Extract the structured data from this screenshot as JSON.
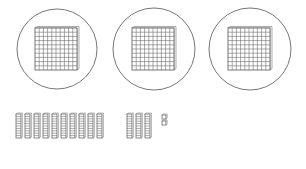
{
  "figure": {
    "colors": {
      "stroke": "#555555",
      "circle": "#777777",
      "fill": "#ffffff"
    },
    "hundreds": {
      "count": 3,
      "circles": [
        {
          "cx": 57,
          "cy": 49,
          "r": 40
        },
        {
          "cx": 154,
          "cy": 49,
          "r": 41
        },
        {
          "cx": 250,
          "cy": 49,
          "r": 41
        }
      ],
      "flat_size": 42,
      "grid": 10
    },
    "tens": {
      "groups": [
        {
          "count": 10,
          "start_x": 16,
          "spacing": 9
        },
        {
          "count": 3,
          "start_x": 127,
          "spacing": 9
        }
      ],
      "rod_width": 5,
      "rod_top": 114,
      "rod_height": 24
    },
    "ones": {
      "count": 2,
      "positions": [
        {
          "x": 162,
          "y": 115
        },
        {
          "x": 162,
          "y": 121
        }
      ],
      "size": 4
    }
  }
}
